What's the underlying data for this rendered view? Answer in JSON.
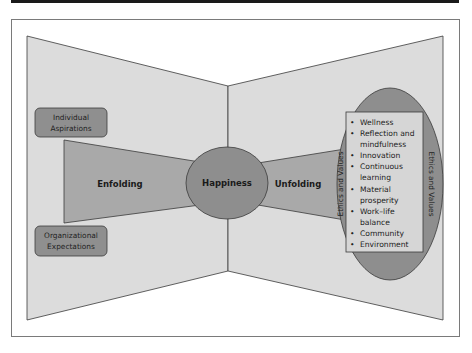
{
  "diagram": {
    "colors": {
      "panel_fill": "#dcdcdc",
      "shape_fill": "#a9a9a9",
      "ellipse_fill": "#8e8e8e",
      "box_fill": "#8f8f8f",
      "list_fill": "#d6d6d6",
      "stroke": "#3a3a3a",
      "frame": "#7a7a7a"
    },
    "left_boxes": {
      "top": {
        "line1": "Individual",
        "line2": "Aspirations"
      },
      "bottom": {
        "line1": "Organizational",
        "line2": "Expectations"
      }
    },
    "enfolding_label": "Enfolding",
    "center_label": "Happiness",
    "unfolding_label": "Unfolding",
    "ellipse_side_label_left": "Ethics and Values",
    "ellipse_side_label_right": "Ethics and Values",
    "list_items": [
      {
        "bullet": "•",
        "lines": [
          "Wellness"
        ]
      },
      {
        "bullet": "•",
        "lines": [
          "Reflection and",
          "mindfulness"
        ]
      },
      {
        "bullet": "•",
        "lines": [
          "Innovation"
        ]
      },
      {
        "bullet": "•",
        "lines": [
          "Continuous",
          "learning"
        ]
      },
      {
        "bullet": "•",
        "lines": [
          "Material",
          "prosperity"
        ]
      },
      {
        "bullet": "•",
        "lines": [
          "Work–life",
          "balance"
        ]
      },
      {
        "bullet": "•",
        "lines": [
          "Community"
        ]
      },
      {
        "bullet": "•",
        "lines": [
          "Environment"
        ]
      }
    ],
    "list_flat": {
      "l0": "Wellness",
      "l1": "Reflection and",
      "l2": "mindfulness",
      "l3": "Innovation",
      "l4": "Continuous",
      "l5": "learning",
      "l6": "Material",
      "l7": "prosperity",
      "l8": "Work–life",
      "l9": "balance",
      "l10": "Community",
      "l11": "Environment",
      "bullet": "•"
    }
  }
}
